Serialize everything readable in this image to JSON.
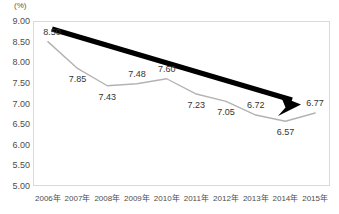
{
  "chart_data": {
    "type": "line",
    "title": "",
    "subtitle": "",
    "xlabel": "",
    "ylabel": "",
    "unit_label": "(%)",
    "categories": [
      "2006年",
      "2007年",
      "2008年",
      "2009年",
      "2010年",
      "2011年",
      "2012年",
      "2013年",
      "2014年",
      "2015年"
    ],
    "values": [
      8.5,
      7.85,
      7.43,
      7.48,
      7.6,
      7.23,
      7.05,
      6.72,
      6.57,
      6.77
    ],
    "point_labels": [
      "8.50",
      "7.85",
      "7.43",
      "7.48",
      "7.60",
      "7.23",
      "7.05",
      "6.72",
      "6.57",
      "6.77"
    ],
    "ylim": [
      5.0,
      9.0
    ],
    "ytick_labels": [
      "9.00",
      "8.50",
      "8.00",
      "7.50",
      "7.00",
      "6.50",
      "6.00",
      "5.50",
      "5.00"
    ],
    "ytick_values": [
      9.0,
      8.5,
      8.0,
      7.5,
      7.0,
      6.5,
      6.0,
      5.5,
      5.0
    ],
    "grid": false,
    "legend": "none",
    "series": [
      {
        "name": "",
        "values": [
          8.5,
          7.85,
          7.43,
          7.48,
          7.6,
          7.23,
          7.05,
          6.72,
          6.57,
          6.77
        ],
        "color": "#b3b3b3"
      }
    ],
    "annotations": [
      {
        "name": "downward-trend-arrow",
        "type": "arrow",
        "color": "#000000",
        "direction": "down-right"
      }
    ],
    "colors": {
      "line": "#b3b3b3",
      "arrow": "#000000",
      "frame": "#d9d9d9",
      "axis_text": "#4d4d4d",
      "label_text": "#333333",
      "background": "#ffffff"
    }
  }
}
